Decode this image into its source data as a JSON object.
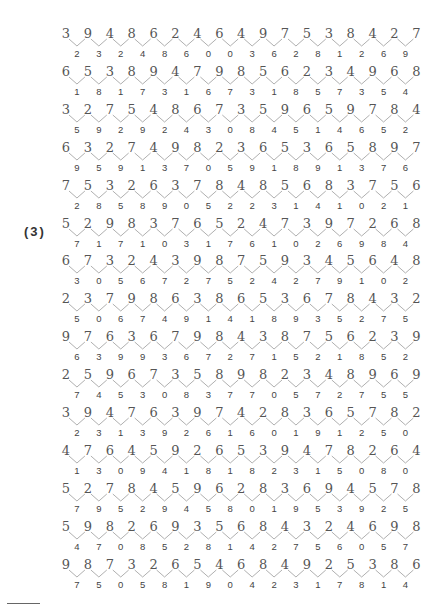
{
  "exercise": {
    "label": "(3)",
    "rows": [
      {
        "top": [
          3,
          9,
          4,
          8,
          6,
          2,
          4,
          6,
          4,
          9,
          7,
          5,
          3,
          8,
          4,
          2,
          7
        ],
        "bottom": [
          2,
          3,
          2,
          4,
          8,
          6,
          0,
          0,
          3,
          6,
          2,
          8,
          1,
          2,
          6,
          9
        ]
      },
      {
        "top": [
          6,
          5,
          3,
          8,
          9,
          4,
          7,
          9,
          8,
          5,
          6,
          2,
          3,
          4,
          9,
          6,
          8
        ],
        "bottom": [
          1,
          8,
          1,
          7,
          3,
          1,
          6,
          7,
          3,
          1,
          8,
          5,
          7,
          3,
          5,
          4
        ]
      },
      {
        "top": [
          3,
          2,
          7,
          5,
          4,
          8,
          6,
          7,
          3,
          5,
          9,
          6,
          5,
          9,
          7,
          8,
          4
        ],
        "bottom": [
          5,
          9,
          2,
          9,
          2,
          4,
          3,
          0,
          8,
          4,
          5,
          1,
          4,
          6,
          5,
          2
        ]
      },
      {
        "top": [
          6,
          3,
          2,
          7,
          4,
          9,
          8,
          2,
          3,
          6,
          5,
          3,
          6,
          5,
          8,
          9,
          7
        ],
        "bottom": [
          9,
          5,
          9,
          1,
          3,
          7,
          0,
          5,
          9,
          1,
          8,
          9,
          1,
          3,
          7,
          6
        ]
      },
      {
        "top": [
          7,
          5,
          3,
          2,
          6,
          3,
          7,
          8,
          4,
          8,
          5,
          6,
          8,
          3,
          7,
          5,
          6
        ],
        "bottom": [
          2,
          8,
          5,
          8,
          9,
          0,
          5,
          2,
          2,
          3,
          1,
          4,
          1,
          0,
          2,
          1
        ]
      },
      {
        "top": [
          5,
          2,
          9,
          8,
          3,
          7,
          6,
          5,
          2,
          4,
          7,
          3,
          9,
          7,
          2,
          6,
          8
        ],
        "bottom": [
          7,
          1,
          7,
          1,
          0,
          3,
          1,
          7,
          6,
          1,
          0,
          2,
          6,
          9,
          8,
          4
        ]
      },
      {
        "top": [
          6,
          7,
          3,
          2,
          4,
          3,
          9,
          8,
          7,
          5,
          9,
          3,
          4,
          5,
          6,
          4,
          8
        ],
        "bottom": [
          3,
          0,
          5,
          6,
          7,
          2,
          7,
          5,
          2,
          4,
          2,
          7,
          9,
          1,
          0,
          2
        ]
      },
      {
        "top": [
          2,
          3,
          7,
          9,
          8,
          6,
          3,
          8,
          6,
          5,
          3,
          6,
          7,
          8,
          4,
          3,
          2
        ],
        "bottom": [
          5,
          0,
          6,
          7,
          4,
          9,
          1,
          4,
          1,
          8,
          9,
          3,
          5,
          2,
          7,
          5
        ]
      },
      {
        "top": [
          9,
          7,
          6,
          3,
          6,
          7,
          9,
          8,
          4,
          3,
          8,
          7,
          5,
          6,
          2,
          3,
          9
        ],
        "bottom": [
          6,
          3,
          9,
          9,
          3,
          6,
          7,
          2,
          7,
          1,
          5,
          2,
          1,
          8,
          5,
          2
        ]
      },
      {
        "top": [
          2,
          5,
          9,
          6,
          7,
          3,
          5,
          8,
          9,
          8,
          2,
          3,
          4,
          8,
          9,
          6,
          9
        ],
        "bottom": [
          7,
          4,
          5,
          3,
          0,
          8,
          3,
          7,
          7,
          0,
          5,
          7,
          2,
          7,
          5,
          5
        ]
      },
      {
        "top": [
          3,
          9,
          4,
          7,
          6,
          3,
          9,
          7,
          4,
          2,
          8,
          3,
          6,
          5,
          7,
          8,
          2
        ],
        "bottom": [
          2,
          3,
          1,
          3,
          9,
          2,
          6,
          1,
          6,
          0,
          1,
          9,
          1,
          2,
          5,
          0
        ]
      },
      {
        "top": [
          4,
          7,
          6,
          4,
          5,
          9,
          2,
          6,
          5,
          3,
          9,
          4,
          7,
          8,
          2,
          6,
          4
        ],
        "bottom": [
          1,
          3,
          0,
          9,
          4,
          1,
          8,
          1,
          8,
          2,
          3,
          1,
          5,
          0,
          8,
          0
        ]
      },
      {
        "top": [
          5,
          2,
          7,
          8,
          4,
          5,
          9,
          6,
          2,
          8,
          3,
          6,
          9,
          4,
          5,
          7,
          8
        ],
        "bottom": [
          7,
          9,
          5,
          2,
          9,
          4,
          5,
          8,
          0,
          1,
          9,
          5,
          3,
          9,
          2,
          5
        ]
      },
      {
        "top": [
          5,
          9,
          8,
          2,
          6,
          9,
          3,
          5,
          6,
          8,
          4,
          3,
          2,
          4,
          6,
          9,
          8
        ],
        "bottom": [
          4,
          7,
          0,
          8,
          5,
          2,
          8,
          1,
          4,
          2,
          7,
          5,
          6,
          0,
          5,
          7
        ]
      },
      {
        "top": [
          9,
          8,
          7,
          3,
          2,
          6,
          5,
          4,
          6,
          8,
          4,
          9,
          2,
          5,
          3,
          8,
          6
        ],
        "bottom": [
          7,
          5,
          0,
          5,
          8,
          1,
          9,
          0,
          4,
          2,
          3,
          1,
          7,
          8,
          1,
          4
        ]
      }
    ]
  },
  "colors": {
    "connector": "#b0b0b0",
    "text": "#555555"
  }
}
